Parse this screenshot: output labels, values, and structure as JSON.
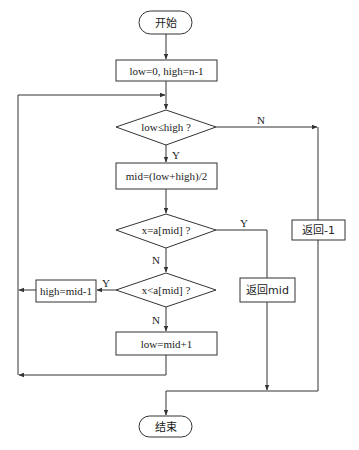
{
  "diagram": {
    "type": "flowchart",
    "nodes": {
      "start": {
        "label": "开始",
        "shape": "terminal"
      },
      "init": {
        "label": "low=0, high=n-1",
        "shape": "process"
      },
      "cond_loop": {
        "label": "low≤high ?",
        "shape": "decision"
      },
      "calc_mid": {
        "label": "mid=(low+high)/2",
        "shape": "process"
      },
      "cond_equal": {
        "label": "x=a[mid] ?",
        "shape": "decision"
      },
      "cond_less": {
        "label": "x<a[mid] ?",
        "shape": "decision"
      },
      "set_high": {
        "label": "high=mid-1",
        "shape": "process"
      },
      "set_low": {
        "label": "low=mid+1",
        "shape": "process"
      },
      "return_mid": {
        "label": "返回mid",
        "shape": "process"
      },
      "return_neg": {
        "label": "返回-1",
        "shape": "process"
      },
      "end": {
        "label": "结束",
        "shape": "terminal"
      }
    },
    "edge_labels": {
      "loop_no": "N",
      "loop_yes": "Y",
      "equal_yes": "Y",
      "equal_no": "N",
      "less_yes": "Y",
      "less_no": "N"
    },
    "edges": [
      {
        "from": "start",
        "to": "init"
      },
      {
        "from": "init",
        "to": "cond_loop"
      },
      {
        "from": "cond_loop",
        "to": "calc_mid",
        "label": "Y"
      },
      {
        "from": "cond_loop",
        "to": "return_neg",
        "label": "N"
      },
      {
        "from": "calc_mid",
        "to": "cond_equal"
      },
      {
        "from": "cond_equal",
        "to": "return_mid",
        "label": "Y"
      },
      {
        "from": "cond_equal",
        "to": "cond_less",
        "label": "N"
      },
      {
        "from": "cond_less",
        "to": "set_high",
        "label": "Y"
      },
      {
        "from": "cond_less",
        "to": "set_low",
        "label": "N"
      },
      {
        "from": "set_high",
        "to": "cond_loop"
      },
      {
        "from": "set_low",
        "to": "cond_loop"
      },
      {
        "from": "return_mid",
        "to": "end"
      },
      {
        "from": "return_neg",
        "to": "end"
      }
    ]
  }
}
